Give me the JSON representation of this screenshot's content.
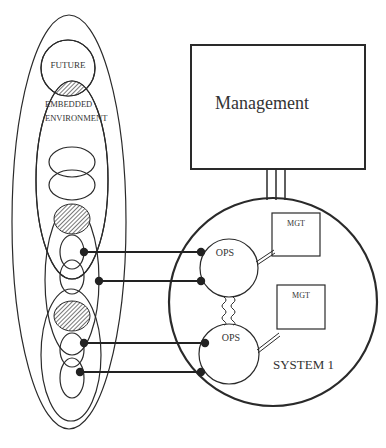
{
  "diagram": {
    "type": "system-environment-diagram",
    "colors": {
      "line": "#2a2a2a",
      "text": "#333333",
      "hatch": "#555555",
      "background": "#ffffff"
    },
    "environment": {
      "future_label": "FUTURE",
      "embedded_label_line1": "EMBEDDED",
      "embedded_label_line2": "ENVIRONMENT"
    },
    "management": {
      "label": "Management"
    },
    "system": {
      "label": "SYSTEM 1",
      "operations": [
        {
          "label": "OPS"
        },
        {
          "label": "OPS"
        }
      ],
      "management_units": [
        {
          "label": "MGT"
        },
        {
          "label": "MGT"
        }
      ]
    },
    "connectors": {
      "count": 4,
      "style": "line with filled dot endpoints"
    }
  }
}
